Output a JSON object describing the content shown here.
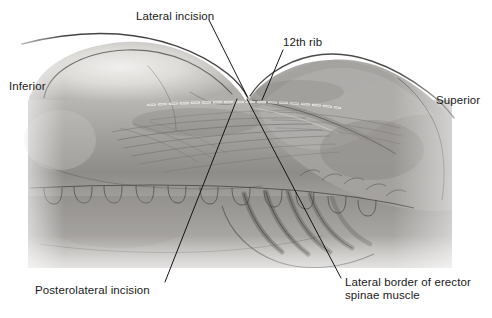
{
  "figure": {
    "type": "anatomical-illustration",
    "style": "grayscale pencil/wash medical drawing",
    "background_color": "#ffffff",
    "ink_color": "#1a1a1a",
    "width": 492,
    "height": 318
  },
  "labels": [
    {
      "id": "lateral-incision",
      "text": "Lateral incision",
      "x": 136,
      "y": 10,
      "leader": {
        "x1": 209,
        "y1": 20,
        "x2": 247,
        "y2": 96
      }
    },
    {
      "id": "twelfth-rib",
      "text": "12th rib",
      "x": 283,
      "y": 36,
      "leader": {
        "x1": 283,
        "y1": 50,
        "x2": 262,
        "y2": 100
      }
    },
    {
      "id": "inferior",
      "text": "Inferior",
      "x": 9,
      "y": 80,
      "leader": null
    },
    {
      "id": "superior",
      "text": "Superior",
      "x": 436,
      "y": 94,
      "leader": null
    },
    {
      "id": "posterolateral-incision",
      "text": "Posterolateral incision",
      "x": 35,
      "y": 284,
      "leader": {
        "x1": 165,
        "y1": 282,
        "x2": 237,
        "y2": 99
      }
    },
    {
      "id": "lateral-border-erector-spinae",
      "text": "Lateral border of erector\nspinae muscle",
      "x": 345,
      "y": 276,
      "leader": {
        "x1": 341,
        "y1": 278,
        "x2": 247,
        "y2": 99
      }
    }
  ],
  "incision_markings": {
    "dashed_line_label": "surgical incision marking",
    "color": "#f2f0ea"
  },
  "anatomy_regions": [
    {
      "name": "iliac-crest-flank-mound",
      "description": "large rounded hip and flank mass at left"
    },
    {
      "name": "twelfth-rib",
      "description": "rib crossing beneath the incision point"
    },
    {
      "name": "erector-spinae-muscle",
      "description": "longitudinal muscle bulk right of midline"
    },
    {
      "name": "rib-cage-bands",
      "description": "curved lower rib bands in lower center-right"
    },
    {
      "name": "vertebral-processes",
      "description": "row of spinous process shapes across mid-figure"
    },
    {
      "name": "shoulder-contour",
      "description": "upper body contour rising toward superior right"
    }
  ]
}
